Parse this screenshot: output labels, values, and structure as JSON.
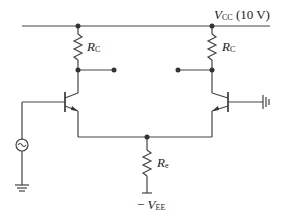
{
  "diagram": {
    "type": "differential-amplifier",
    "supply": {
      "name": "V",
      "sub": "CC",
      "value": "(10 V)"
    },
    "negative_supply": {
      "prefix": "− ",
      "name": "V",
      "sub": "EE"
    },
    "resistors": {
      "rc_left": {
        "name": "R",
        "sub": "C"
      },
      "rc_right": {
        "name": "R",
        "sub": "C"
      },
      "re": {
        "name": "R",
        "sub": "e"
      }
    },
    "components": [
      "NPN transistor Q1",
      "NPN transistor Q2",
      "AC signal source",
      "ground",
      "ground"
    ],
    "colors": {
      "line": "#444444",
      "text": "#222222"
    }
  }
}
